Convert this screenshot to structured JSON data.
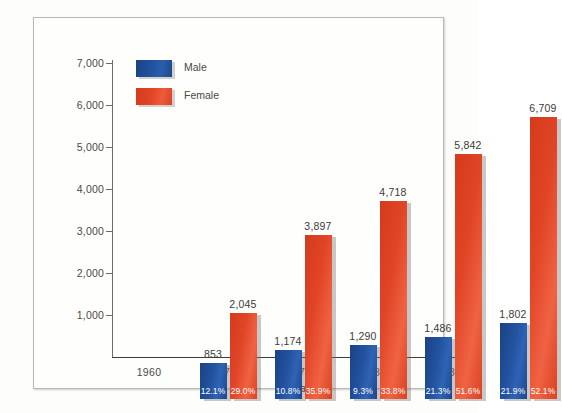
{
  "chart_data": {
    "type": "bar",
    "title": "",
    "xlabel": "Year",
    "ylabel": "",
    "categories": [
      "1960",
      "1970",
      "1975",
      "1980",
      "1987"
    ],
    "ylim": [
      0,
      7000
    ],
    "yticks": [
      "1,000",
      "2,000",
      "3,000",
      "4,000",
      "5,000",
      "6,000",
      "7,000"
    ],
    "ytick_values": [
      1000,
      2000,
      3000,
      4000,
      5000,
      6000,
      7000
    ],
    "grid": false,
    "legend_position": "top-left",
    "series": [
      {
        "name": "Male",
        "color": "#22529f",
        "values": [
          853,
          1174,
          1290,
          1486,
          1802
        ],
        "value_labels": [
          "853",
          "1,174",
          "1,290",
          "1,486",
          "1,802"
        ],
        "percent_labels": [
          "12.1%",
          "10.8%",
          "9.3%",
          "21.3%",
          "21.9%"
        ]
      },
      {
        "name": "Female",
        "color": "#e14527",
        "values": [
          2045,
          3897,
          4718,
          5842,
          6709
        ],
        "value_labels": [
          "2,045",
          "3,897",
          "4,718",
          "5,842",
          "6,709"
        ],
        "percent_labels": [
          "29.0%",
          "35.9%",
          "33.8%",
          "51.6%",
          "52.1%"
        ]
      }
    ]
  },
  "legend": {
    "items": [
      {
        "label": "Male",
        "swatch": "male-swatch"
      },
      {
        "label": "Female",
        "swatch": "female-swatch"
      }
    ]
  },
  "axes": {
    "x_title": "Year"
  }
}
